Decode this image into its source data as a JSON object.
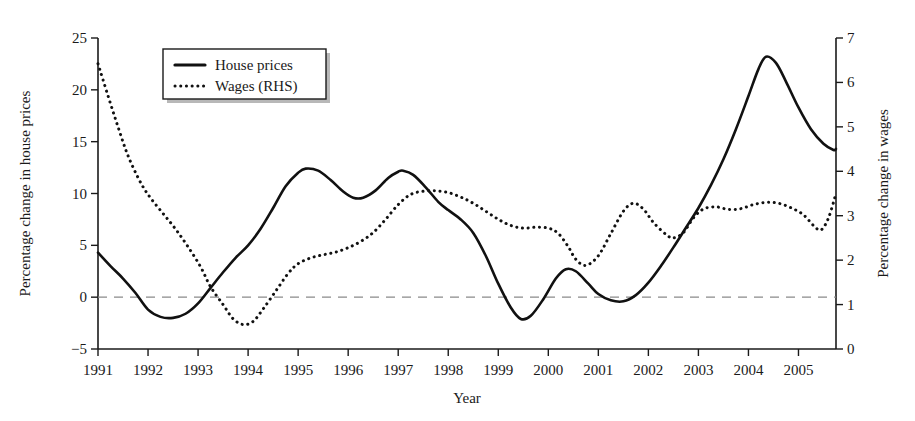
{
  "chart_data": {
    "type": "line",
    "title": "",
    "xlabel": "Year",
    "ylabel": "Percentage change in house prices",
    "y2label": "Percentage change in wages",
    "xlim": [
      1991,
      2005.75
    ],
    "ylim": [
      -5,
      25
    ],
    "y2lim": [
      0,
      7
    ],
    "xticks": [
      1991,
      1992,
      1993,
      1994,
      1995,
      1996,
      1997,
      1998,
      1999,
      2000,
      2001,
      2002,
      2003,
      2004,
      2005
    ],
    "xtick_labels": [
      "1991",
      "1992",
      "1993",
      "1994",
      "1995",
      "1996",
      "1997",
      "1998",
      "1999",
      "2000",
      "2001",
      "2002",
      "2003",
      "2004",
      "2005"
    ],
    "yticks": [
      -5,
      0,
      5,
      10,
      15,
      20,
      25
    ],
    "ytick_labels": [
      "−5",
      "0",
      "5",
      "10",
      "15",
      "20",
      "25"
    ],
    "y2ticks": [
      0,
      1,
      2,
      3,
      4,
      5,
      6,
      7
    ],
    "y2tick_labels": [
      "0",
      "1",
      "2",
      "3",
      "4",
      "5",
      "6",
      "7"
    ],
    "grid": false,
    "zero_reference_line": 0,
    "legend_position": "top-left-inside",
    "legend": [
      "House prices",
      "Wages (RHS)"
    ],
    "series": [
      {
        "name": "House prices",
        "axis": "left",
        "style": "solid",
        "color": "#111111",
        "points": [
          [
            1991.0,
            4.3
          ],
          [
            1991.25,
            3.0
          ],
          [
            1991.5,
            1.8
          ],
          [
            1991.75,
            0.4
          ],
          [
            1992.0,
            -1.2
          ],
          [
            1992.25,
            -1.9
          ],
          [
            1992.5,
            -2.0
          ],
          [
            1992.75,
            -1.6
          ],
          [
            1993.0,
            -0.6
          ],
          [
            1993.25,
            0.9
          ],
          [
            1993.5,
            2.4
          ],
          [
            1993.75,
            3.8
          ],
          [
            1994.0,
            5.0
          ],
          [
            1994.25,
            6.6
          ],
          [
            1994.5,
            8.6
          ],
          [
            1994.75,
            10.7
          ],
          [
            1995.0,
            12.0
          ],
          [
            1995.15,
            12.4
          ],
          [
            1995.4,
            12.2
          ],
          [
            1995.65,
            11.3
          ],
          [
            1995.9,
            10.2
          ],
          [
            1996.1,
            9.6
          ],
          [
            1996.3,
            9.6
          ],
          [
            1996.55,
            10.3
          ],
          [
            1996.8,
            11.5
          ],
          [
            1997.0,
            12.1
          ],
          [
            1997.1,
            12.2
          ],
          [
            1997.3,
            11.8
          ],
          [
            1997.55,
            10.6
          ],
          [
            1997.8,
            9.2
          ],
          [
            1998.0,
            8.4
          ],
          [
            1998.25,
            7.5
          ],
          [
            1998.5,
            6.2
          ],
          [
            1998.75,
            4.0
          ],
          [
            1999.0,
            1.3
          ],
          [
            1999.25,
            -1.0
          ],
          [
            1999.45,
            -2.1
          ],
          [
            1999.65,
            -1.8
          ],
          [
            1999.9,
            -0.2
          ],
          [
            2000.15,
            1.8
          ],
          [
            2000.35,
            2.7
          ],
          [
            2000.55,
            2.5
          ],
          [
            2000.8,
            1.3
          ],
          [
            2001.0,
            0.3
          ],
          [
            2001.25,
            -0.3
          ],
          [
            2001.5,
            -0.4
          ],
          [
            2001.75,
            0.2
          ],
          [
            2002.0,
            1.4
          ],
          [
            2002.25,
            3.0
          ],
          [
            2002.5,
            4.8
          ],
          [
            2002.75,
            6.7
          ],
          [
            2003.0,
            8.6
          ],
          [
            2003.25,
            10.8
          ],
          [
            2003.5,
            13.3
          ],
          [
            2003.75,
            16.2
          ],
          [
            2004.0,
            19.4
          ],
          [
            2004.2,
            22.0
          ],
          [
            2004.35,
            23.2
          ],
          [
            2004.55,
            22.6
          ],
          [
            2004.75,
            20.8
          ],
          [
            2005.0,
            18.3
          ],
          [
            2005.25,
            16.2
          ],
          [
            2005.5,
            14.8
          ],
          [
            2005.7,
            14.2
          ],
          [
            2005.75,
            14.3
          ]
        ]
      },
      {
        "name": "Wages (RHS)",
        "axis": "right",
        "style": "dotted",
        "color": "#111111",
        "points": [
          [
            1991.0,
            6.42
          ],
          [
            1991.2,
            5.7
          ],
          [
            1991.4,
            5.0
          ],
          [
            1991.6,
            4.35
          ],
          [
            1991.85,
            3.75
          ],
          [
            1992.05,
            3.4
          ],
          [
            1992.3,
            3.05
          ],
          [
            1992.55,
            2.7
          ],
          [
            1992.8,
            2.3
          ],
          [
            1993.05,
            1.85
          ],
          [
            1993.25,
            1.4
          ],
          [
            1993.5,
            1.0
          ],
          [
            1993.7,
            0.68
          ],
          [
            1993.9,
            0.55
          ],
          [
            1994.1,
            0.62
          ],
          [
            1994.3,
            0.9
          ],
          [
            1994.55,
            1.3
          ],
          [
            1994.8,
            1.7
          ],
          [
            1995.0,
            1.92
          ],
          [
            1995.25,
            2.05
          ],
          [
            1995.5,
            2.12
          ],
          [
            1995.75,
            2.18
          ],
          [
            1996.0,
            2.28
          ],
          [
            1996.25,
            2.42
          ],
          [
            1996.5,
            2.62
          ],
          [
            1996.75,
            2.92
          ],
          [
            1997.0,
            3.25
          ],
          [
            1997.25,
            3.48
          ],
          [
            1997.5,
            3.55
          ],
          [
            1997.75,
            3.56
          ],
          [
            1998.0,
            3.52
          ],
          [
            1998.25,
            3.42
          ],
          [
            1998.5,
            3.28
          ],
          [
            1998.75,
            3.1
          ],
          [
            1999.0,
            2.92
          ],
          [
            1999.25,
            2.78
          ],
          [
            1999.5,
            2.72
          ],
          [
            1999.75,
            2.74
          ],
          [
            2000.0,
            2.72
          ],
          [
            2000.2,
            2.6
          ],
          [
            2000.4,
            2.3
          ],
          [
            2000.55,
            2.02
          ],
          [
            2000.75,
            1.88
          ],
          [
            2001.0,
            2.1
          ],
          [
            2001.25,
            2.6
          ],
          [
            2001.5,
            3.1
          ],
          [
            2001.7,
            3.28
          ],
          [
            2001.9,
            3.15
          ],
          [
            2002.1,
            2.85
          ],
          [
            2002.35,
            2.58
          ],
          [
            2002.5,
            2.5
          ],
          [
            2002.7,
            2.62
          ],
          [
            2002.9,
            2.95
          ],
          [
            2003.1,
            3.15
          ],
          [
            2003.35,
            3.2
          ],
          [
            2003.6,
            3.14
          ],
          [
            2003.85,
            3.16
          ],
          [
            2004.1,
            3.25
          ],
          [
            2004.35,
            3.3
          ],
          [
            2004.6,
            3.28
          ],
          [
            2004.85,
            3.18
          ],
          [
            2005.1,
            3.02
          ],
          [
            2005.3,
            2.78
          ],
          [
            2005.45,
            2.68
          ],
          [
            2005.6,
            2.95
          ],
          [
            2005.75,
            3.5
          ]
        ]
      }
    ]
  }
}
